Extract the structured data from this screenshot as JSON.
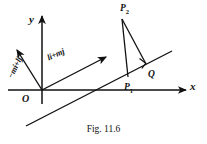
{
  "figure": {
    "caption": "Fig. 11.6",
    "background_color": "#ffffff",
    "ink_color": "#111111",
    "width": 207,
    "height": 144,
    "axes": {
      "x_label": "x",
      "y_label": "y",
      "origin_label": "O"
    },
    "points": [
      {
        "name": "point-p2",
        "label": "P",
        "subscript": "2"
      },
      {
        "name": "point-p1",
        "label": "P",
        "subscript": "1"
      },
      {
        "name": "point-q",
        "label": "Q",
        "subscript": ""
      }
    ],
    "vectors": [
      {
        "name": "direction-vector",
        "label": "li+mj"
      },
      {
        "name": "normal-vector",
        "label": "−mi+lj"
      }
    ],
    "marks": {
      "right_angle": "right-angle-mark"
    }
  }
}
